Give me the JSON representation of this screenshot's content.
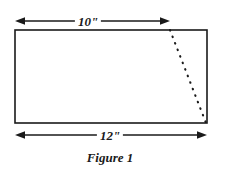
{
  "figure": {
    "caption": "Figure 1",
    "background_color": "#ffffff",
    "stroke_color": "#1a1a1a",
    "shape": {
      "name": "rectangle",
      "x": 15,
      "y": 30,
      "width": 192,
      "height": 93,
      "fill": "#ffffff",
      "stroke_width": 1.6
    },
    "dimensions": [
      {
        "id": "top",
        "label": "10\"",
        "value": 10,
        "unit": "inches",
        "orientation": "horizontal",
        "y": 21,
        "x_start": 15,
        "x_end": 170,
        "arrowheads": "both"
      },
      {
        "id": "bottom",
        "label": "12\"",
        "value": 12,
        "unit": "inches",
        "orientation": "horizontal",
        "y": 135,
        "x_start": 15,
        "x_end": 207,
        "arrowheads": "both"
      }
    ],
    "dotted_line": {
      "name": "fold-line",
      "style": "dotted",
      "x1": 170,
      "y1": 30,
      "x2": 206,
      "y2": 123,
      "dot_color": "#1a1a1a"
    }
  }
}
